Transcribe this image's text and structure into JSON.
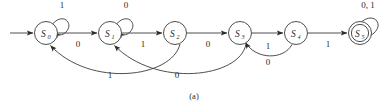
{
  "figure": {
    "caption": "(a)",
    "type": "finite-state-machine-diagram",
    "ink_color": "#3a3a3a",
    "text_color": "#2b2b2b",
    "background_color": "#ffffff"
  },
  "states": [
    {
      "id": "S0",
      "base": "S",
      "sub": "0",
      "cx": 46,
      "cy": 33,
      "r": 11.5,
      "accepting": false,
      "start": true
    },
    {
      "id": "S1",
      "base": "S",
      "sub": "1",
      "cx": 110,
      "cy": 33,
      "r": 11.5,
      "accepting": false,
      "start": false
    },
    {
      "id": "S2",
      "base": "S",
      "sub": "2",
      "cx": 175,
      "cy": 33,
      "r": 11.5,
      "accepting": false,
      "start": false
    },
    {
      "id": "S3",
      "base": "S",
      "sub": "3",
      "cx": 240,
      "cy": 33,
      "r": 11.5,
      "accepting": false,
      "start": false
    },
    {
      "id": "S4",
      "base": "S",
      "sub": "4",
      "cx": 296,
      "cy": 33,
      "r": 11.5,
      "accepting": false,
      "start": false
    },
    {
      "id": "S5",
      "base": "S",
      "sub": "5",
      "cx": 360,
      "cy": 33,
      "r": 11.5,
      "accepting": true,
      "start": false
    }
  ],
  "transitions": [
    {
      "name": "start-arrow",
      "from": "",
      "to": "S0",
      "label": "",
      "kind": "start"
    },
    {
      "name": "S0-self",
      "from": "S0",
      "to": "S0",
      "label": "1",
      "kind": "self",
      "label_x": 62,
      "label_y": 8
    },
    {
      "name": "S1-self",
      "from": "S1",
      "to": "S1",
      "label": "0",
      "kind": "self",
      "label_x": 126,
      "label_y": 8
    },
    {
      "name": "S5-self",
      "from": "S5",
      "to": "S5",
      "label": "0, 1",
      "kind": "self",
      "label_x": 368,
      "label_y": 8
    },
    {
      "name": "S0-to-S1",
      "from": "S0",
      "to": "S1",
      "label": "0",
      "kind": "forward",
      "label_x": 78,
      "label_y": 47
    },
    {
      "name": "S1-to-S2",
      "from": "S1",
      "to": "S2",
      "label": "1",
      "kind": "forward",
      "label_x": 143,
      "label_y": 47
    },
    {
      "name": "S2-to-S3",
      "from": "S2",
      "to": "S3",
      "label": "0",
      "kind": "forward",
      "label_x": 208,
      "label_y": 47
    },
    {
      "name": "S3-to-S4",
      "from": "S3",
      "to": "S4",
      "label": "1",
      "kind": "forward",
      "label_x": 268,
      "label_y": 49
    },
    {
      "name": "S4-to-S5",
      "from": "S4",
      "to": "S5",
      "label": "1",
      "kind": "forward",
      "label_x": 328,
      "label_y": 47
    },
    {
      "name": "S2-to-S0-back",
      "from": "S2",
      "to": "S0",
      "label": "1",
      "kind": "back",
      "label_x": 110,
      "label_y": 78
    },
    {
      "name": "S3-to-S1-back",
      "from": "S3",
      "to": "S1",
      "label": "0",
      "kind": "back",
      "label_x": 177,
      "label_y": 78
    },
    {
      "name": "S4-to-S3-back",
      "from": "S4",
      "to": "S3",
      "label": "0",
      "kind": "back",
      "label_x": 268,
      "label_y": 65
    }
  ]
}
